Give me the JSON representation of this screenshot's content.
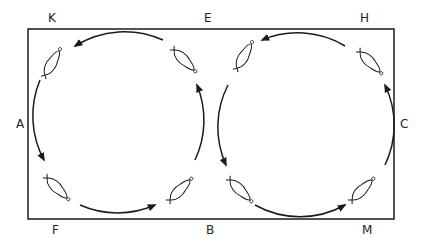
{
  "diagram": {
    "type": "figure-eight swimming/skating path around rectangle",
    "labels": {
      "K": "K",
      "E": "E",
      "H": "H",
      "A": "A",
      "C": "C",
      "F": "F",
      "B": "B",
      "M": "M"
    },
    "colors": {
      "stroke": "#1a1a1a",
      "background": "#ffffff"
    }
  }
}
